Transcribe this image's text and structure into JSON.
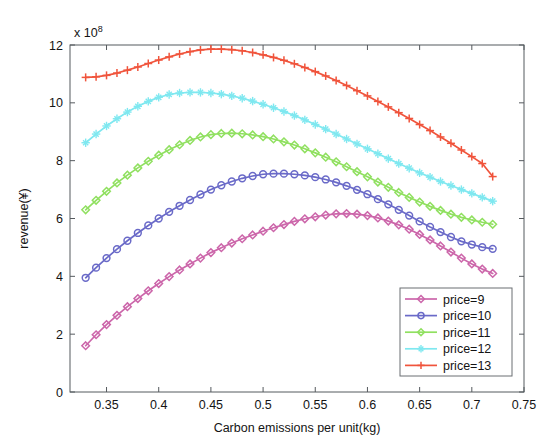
{
  "chart_data": {
    "type": "line",
    "title": "",
    "xlabel": "Carbon emissions per unit(kg)",
    "ylabel": "revenue(¥)",
    "y_multiplier": "x 10",
    "y_multiplier_exp": "8",
    "xlim": [
      0.315,
      0.75
    ],
    "ylim": [
      0,
      12
    ],
    "grid": false,
    "legend_position": "lower right",
    "xticks": [
      "0.35",
      "0.4",
      "0.45",
      "0.5",
      "0.55",
      "0.6",
      "0.65",
      "0.7",
      "0.75"
    ],
    "xtick_values": [
      0.35,
      0.4,
      0.45,
      0.5,
      0.55,
      0.6,
      0.65,
      0.7,
      0.75
    ],
    "yticks": [
      "0",
      "2",
      "4",
      "6",
      "8",
      "10",
      "12"
    ],
    "ytick_values": [
      0,
      2,
      4,
      6,
      8,
      10,
      12
    ],
    "x": [
      0.33,
      0.34,
      0.35,
      0.36,
      0.37,
      0.38,
      0.39,
      0.4,
      0.41,
      0.42,
      0.43,
      0.44,
      0.45,
      0.46,
      0.47,
      0.48,
      0.49,
      0.5,
      0.51,
      0.52,
      0.53,
      0.54,
      0.55,
      0.56,
      0.57,
      0.58,
      0.59,
      0.6,
      0.61,
      0.62,
      0.63,
      0.64,
      0.65,
      0.66,
      0.67,
      0.68,
      0.69,
      0.7,
      0.71,
      0.72
    ],
    "series": [
      {
        "name": "price=9",
        "color": "#cc66aa",
        "marker": "diamond",
        "values": [
          1.6,
          1.98,
          2.33,
          2.65,
          2.95,
          3.23,
          3.5,
          3.75,
          3.99,
          4.22,
          4.43,
          4.63,
          4.82,
          4.99,
          5.15,
          5.3,
          5.43,
          5.56,
          5.68,
          5.79,
          5.9,
          5.99,
          6.06,
          6.12,
          6.16,
          6.17,
          6.15,
          6.1,
          6.02,
          5.91,
          5.78,
          5.63,
          5.45,
          5.26,
          5.05,
          4.84,
          4.63,
          4.43,
          4.25,
          4.1
        ]
      },
      {
        "name": "price=10",
        "color": "#6a6ac8",
        "marker": "circle",
        "values": [
          3.95,
          4.3,
          4.63,
          4.94,
          5.23,
          5.5,
          5.76,
          6.0,
          6.23,
          6.44,
          6.64,
          6.83,
          7.0,
          7.15,
          7.28,
          7.39,
          7.47,
          7.53,
          7.55,
          7.55,
          7.53,
          7.49,
          7.43,
          7.35,
          7.25,
          7.13,
          6.99,
          6.84,
          6.67,
          6.49,
          6.3,
          6.1,
          5.9,
          5.71,
          5.53,
          5.36,
          5.21,
          5.1,
          5.01,
          4.95
        ]
      },
      {
        "name": "price=11",
        "color": "#90e060",
        "marker": "diamond",
        "values": [
          6.3,
          6.63,
          6.94,
          7.23,
          7.5,
          7.75,
          7.98,
          8.19,
          8.38,
          8.55,
          8.7,
          8.82,
          8.9,
          8.94,
          8.95,
          8.93,
          8.89,
          8.83,
          8.75,
          8.65,
          8.54,
          8.41,
          8.27,
          8.12,
          7.96,
          7.79,
          7.62,
          7.44,
          7.26,
          7.08,
          6.9,
          6.73,
          6.57,
          6.42,
          6.28,
          6.15,
          6.04,
          5.95,
          5.87,
          5.8
        ]
      },
      {
        "name": "price=12",
        "color": "#7fe8f0",
        "marker": "star",
        "values": [
          8.62,
          8.92,
          9.2,
          9.45,
          9.68,
          9.88,
          10.05,
          10.19,
          10.29,
          10.34,
          10.36,
          10.36,
          10.34,
          10.3,
          10.24,
          10.16,
          10.06,
          9.95,
          9.83,
          9.7,
          9.56,
          9.41,
          9.25,
          9.09,
          8.92,
          8.75,
          8.58,
          8.41,
          8.24,
          8.07,
          7.9,
          7.74,
          7.58,
          7.43,
          7.28,
          7.14,
          7.0,
          6.87,
          6.73,
          6.6
        ]
      },
      {
        "name": "price=13",
        "color": "#f0543c",
        "marker": "plus",
        "values": [
          10.88,
          10.9,
          10.95,
          11.03,
          11.13,
          11.24,
          11.36,
          11.48,
          11.59,
          11.69,
          11.77,
          11.83,
          11.86,
          11.86,
          11.84,
          11.8,
          11.74,
          11.66,
          11.57,
          11.47,
          11.35,
          11.22,
          11.08,
          10.93,
          10.77,
          10.6,
          10.42,
          10.24,
          10.05,
          9.86,
          9.66,
          9.46,
          9.25,
          9.04,
          8.82,
          8.6,
          8.37,
          8.14,
          7.9,
          7.45
        ]
      }
    ]
  }
}
